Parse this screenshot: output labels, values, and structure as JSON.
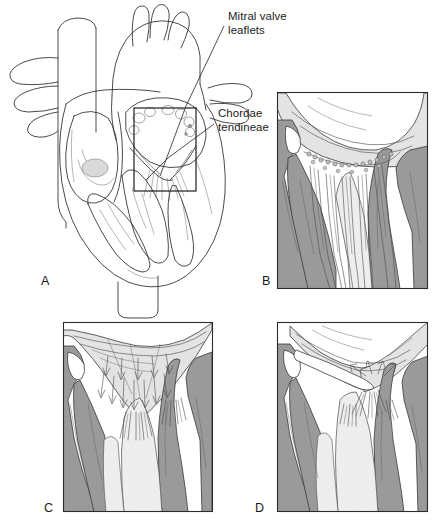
{
  "figure": {
    "background_color": "#ffffff",
    "ink_color": "#1a1a1a",
    "palette": {
      "muscle_gray": "#9a9a9a",
      "muscle_gray_dark": "#8a8a8a",
      "leaflet_light": "#e9e9e9",
      "tissue_pale": "#dcdcdc",
      "chamber_white": "#ffffff",
      "outline": "#2b2b2b"
    }
  },
  "callouts": [
    {
      "id": "mitral-valve-leaflets",
      "line1": "Mitral valve",
      "line2": "leaflets",
      "x": 228,
      "y": 20
    },
    {
      "id": "chordae-tendineae",
      "line1": "Chordae",
      "line2": "tendineae",
      "x": 218,
      "y": 117
    }
  ],
  "panels": [
    {
      "id": "panel-a",
      "letter": "A",
      "label_x": 41,
      "label_y": 285,
      "description": "Coronal section of whole heart showing mitral valve in situ with inset region of interest",
      "has_frame": false
    },
    {
      "id": "panel-b",
      "letter": "B",
      "label_x": 262,
      "label_y": 285,
      "description": "Closed mitral valve during ventricular systole with taut chordae tendineae",
      "has_frame": true,
      "frame": {
        "x": 277,
        "y": 92,
        "width": 151,
        "height": 197
      }
    },
    {
      "id": "panel-c",
      "letter": "C",
      "label_x": 44,
      "label_y": 512,
      "description": "Open mitral valve during ventricular filling with inflow arrows",
      "has_frame": true,
      "frame": {
        "x": 63,
        "y": 322,
        "width": 150,
        "height": 190
      }
    },
    {
      "id": "panel-d",
      "letter": "D",
      "label_x": 255,
      "label_y": 512,
      "description": "Mitral valve closing as leaflets float upward at end of filling",
      "has_frame": true,
      "frame": {
        "x": 277,
        "y": 322,
        "width": 151,
        "height": 190
      }
    }
  ],
  "inset_box": {
    "x": 134,
    "y": 108,
    "width": 62,
    "height": 83
  }
}
